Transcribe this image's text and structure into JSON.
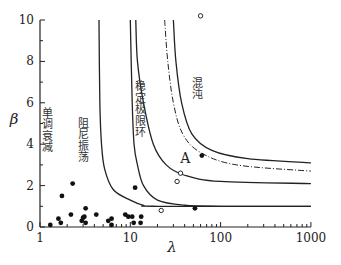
{
  "chart_data": {
    "type": "scatter",
    "title": "",
    "xlabel": "λ",
    "ylabel": "β",
    "xscale": "log",
    "xlim": [
      1,
      1000
    ],
    "ylim": [
      0,
      10
    ],
    "x_ticks": [
      "1",
      "10",
      "100",
      "1000"
    ],
    "y_ticks": [
      "0",
      "2",
      "4",
      "6",
      "8",
      "10"
    ],
    "grid": false,
    "legend": null,
    "regions": [
      {
        "label": "单调衰减",
        "x": 1.2,
        "y": 4.5
      },
      {
        "label": "阻尼振荡",
        "x": 3.0,
        "y": 4.0
      },
      {
        "label": "稳定极限环",
        "x": 13,
        "y": 5.5
      },
      {
        "label": "混沌",
        "x": 55,
        "y": 6.5
      }
    ],
    "boundaries": [
      {
        "name": "damped-to-limit-cycle",
        "style": "solid",
        "points": [
          [
            10,
            10
          ],
          [
            10.5,
            6
          ],
          [
            11,
            4
          ],
          [
            12,
            3
          ],
          [
            14,
            2
          ],
          [
            20,
            1.3
          ],
          [
            40,
            1.05
          ],
          [
            100,
            1.0
          ],
          [
            1000,
            1.0
          ]
        ]
      },
      {
        "name": "monotone-to-damped",
        "style": "solid",
        "points": [
          [
            4.5,
            10
          ],
          [
            4.6,
            6
          ],
          [
            4.8,
            4
          ],
          [
            5.2,
            2.8
          ],
          [
            6.5,
            1.8
          ],
          [
            10,
            1.3
          ],
          [
            14,
            1.05
          ],
          [
            20,
            1.0
          ],
          [
            1000,
            1.0
          ]
        ]
      },
      {
        "name": "limit-cycle-boundary",
        "style": "solid",
        "points": [
          [
            11.5,
            10
          ],
          [
            12,
            8
          ],
          [
            14,
            6
          ],
          [
            18,
            4
          ],
          [
            25,
            3
          ],
          [
            40,
            2.5
          ],
          [
            100,
            2.2
          ],
          [
            1000,
            2.1
          ]
        ]
      },
      {
        "name": "chaos-threshold-dashed",
        "style": "dashed",
        "points": [
          [
            24,
            10
          ],
          [
            26,
            8
          ],
          [
            30,
            6
          ],
          [
            38,
            4.5
          ],
          [
            60,
            3.6
          ],
          [
            150,
            3.0
          ],
          [
            1000,
            2.7
          ]
        ]
      },
      {
        "name": "chaos-boundary",
        "style": "solid",
        "points": [
          [
            30,
            10
          ],
          [
            32,
            8
          ],
          [
            37,
            6
          ],
          [
            48,
            4.5
          ],
          [
            80,
            3.7
          ],
          [
            200,
            3.3
          ],
          [
            1000,
            3.1
          ]
        ]
      }
    ],
    "series": [
      {
        "name": "filled",
        "marker": "filled-circle",
        "points": [
          [
            1.3,
            0.1
          ],
          [
            1.6,
            0.4
          ],
          [
            1.7,
            0.2
          ],
          [
            1.75,
            1.5
          ],
          [
            2.2,
            0.6
          ],
          [
            2.3,
            2.1
          ],
          [
            2.9,
            0.3
          ],
          [
            3.0,
            0.45
          ],
          [
            3.1,
            0.5
          ],
          [
            3.2,
            0.2
          ],
          [
            3.2,
            0.9
          ],
          [
            4.2,
            0.6
          ],
          [
            5.7,
            0.3
          ],
          [
            6.2,
            0.4
          ],
          [
            6.2,
            0.1
          ],
          [
            8.8,
            0.6
          ],
          [
            9.5,
            0.5
          ],
          [
            10.5,
            0.5
          ],
          [
            10.9,
            0.2
          ],
          [
            11.3,
            1.9
          ],
          [
            13.0,
            0.2
          ],
          [
            13.2,
            0.5
          ],
          [
            52,
            0.9
          ],
          [
            62,
            3.45
          ]
        ]
      },
      {
        "name": "open",
        "marker": "open-circle",
        "points": [
          [
            22,
            0.8
          ],
          [
            33,
            2.2
          ],
          [
            36,
            2.6
          ],
          [
            60,
            10.2
          ]
        ]
      }
    ],
    "annotations": [
      {
        "text": "A",
        "x": 50,
        "y": 3.4
      }
    ]
  }
}
